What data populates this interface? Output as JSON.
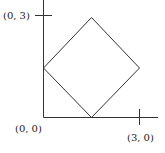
{
  "diagram": {
    "type": "coordinate-plot",
    "axes": {
      "x_tick_label": "(3, 0)",
      "y_tick_label": "(0, 3)",
      "origin_label": "(0, 0)"
    },
    "shape": {
      "name": "square rotated 45 degrees (diamond)",
      "vertices_data": [
        [
          0,
          1.5
        ],
        [
          1.5,
          0
        ],
        [
          3,
          1.5
        ],
        [
          1.5,
          3
        ]
      ]
    },
    "colors": {
      "line": "#333333",
      "text": "#222222",
      "background": "#ffffff"
    }
  }
}
